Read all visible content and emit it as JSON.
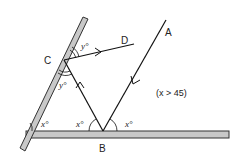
{
  "diagram": {
    "labels": {
      "A": "A",
      "B": "B",
      "C": "C",
      "D": "D"
    },
    "angles": {
      "y_top": "y°",
      "y_bottom": "y°",
      "x_left_mirror": "x°",
      "x_at_B_left": "x°",
      "x_at_B_right": "x°"
    },
    "condition": "(x > 45)",
    "colors": {
      "mirror_fill": "#c8c8c8",
      "mirror_stroke": "#333333",
      "line": "#111111"
    }
  }
}
